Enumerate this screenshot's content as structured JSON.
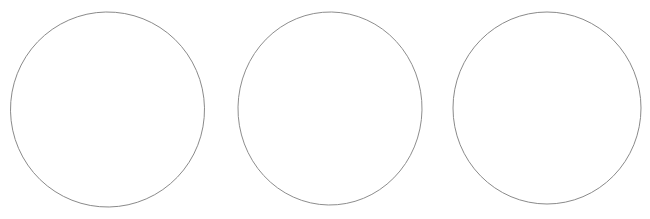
{
  "canvas": {
    "width": 650,
    "height": 219,
    "background_color": "#ffffff",
    "title": ""
  },
  "figure": {
    "kind": "line-drawing",
    "shape_count": 3,
    "stroke_color": "#8a8a8a",
    "stroke_width": 1,
    "fill": "none"
  },
  "shapes": [
    {
      "id": "circle-1",
      "type": "circle",
      "label": "",
      "cx": 107.5,
      "cy": 109.5,
      "rx": 97,
      "ry": 97.5,
      "rotation": -1,
      "stroke_color": "#8a8a8a",
      "stroke_width": 1,
      "fill": "none"
    },
    {
      "id": "circle-2",
      "type": "circle",
      "label": "",
      "cx": 330,
      "cy": 108.5,
      "rx": 92,
      "ry": 96.5,
      "rotation": 1,
      "stroke_color": "#8d8d8d",
      "stroke_width": 1,
      "fill": "none"
    },
    {
      "id": "circle-3",
      "type": "circle",
      "label": "",
      "cx": 547,
      "cy": 108,
      "rx": 94,
      "ry": 96,
      "rotation": 0,
      "stroke_color": "#8a8a8a",
      "stroke_width": 1,
      "fill": "none"
    }
  ],
  "captions": []
}
